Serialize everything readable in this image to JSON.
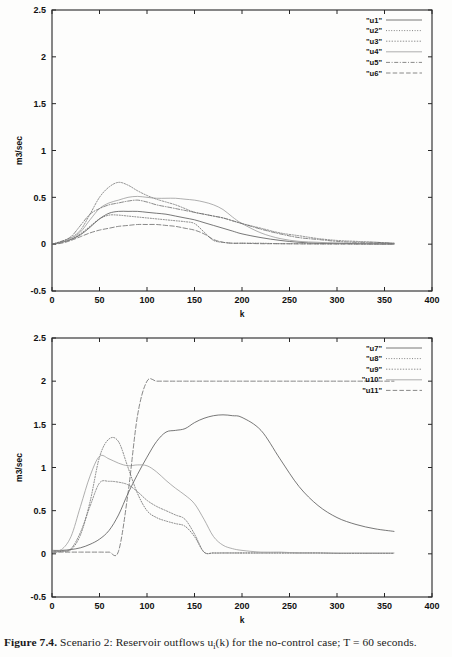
{
  "figure": {
    "caption_label": "Figure 7.4.",
    "caption_text_1": "Scenario 2: Reservoir outflows u",
    "caption_sub": "i",
    "caption_text_2": "(k) for the no-control case; T = 60 seconds."
  },
  "chart_data": [
    {
      "id": "top-chart",
      "type": "line",
      "title": "",
      "xlabel": "k",
      "ylabel": "m3/sec",
      "xlim": [
        0,
        400
      ],
      "ylim": [
        -0.5,
        2.5
      ],
      "xticks": [
        0,
        50,
        100,
        150,
        200,
        250,
        300,
        350,
        400
      ],
      "yticks": [
        -0.5,
        0,
        0.5,
        1,
        1.5,
        2,
        2.5
      ],
      "grid": false,
      "legend_position": "top-right",
      "legend_entries": [
        "\"u1\"",
        "\"u2\"",
        "\"u3\"",
        "\"u4\"",
        "\"u5\"",
        "\"u6\""
      ],
      "x": [
        0,
        10,
        20,
        30,
        40,
        50,
        60,
        70,
        80,
        90,
        100,
        110,
        120,
        130,
        140,
        150,
        160,
        170,
        180,
        190,
        200,
        220,
        240,
        260,
        280,
        300,
        320,
        340,
        360
      ],
      "series": [
        {
          "name": "\"u1\"",
          "dash": "solid",
          "values": [
            0.0,
            0.02,
            0.05,
            0.1,
            0.18,
            0.27,
            0.33,
            0.35,
            0.35,
            0.35,
            0.34,
            0.33,
            0.32,
            0.3,
            0.28,
            0.26,
            0.23,
            0.2,
            0.17,
            0.14,
            0.11,
            0.07,
            0.04,
            0.02,
            0.01,
            0.01,
            0.005,
            0.003,
            0.002
          ]
        },
        {
          "name": "\"u2\"",
          "dash": "dotted-fine",
          "values": [
            0.0,
            0.02,
            0.05,
            0.11,
            0.19,
            0.27,
            0.31,
            0.31,
            0.3,
            0.29,
            0.28,
            0.27,
            0.26,
            0.25,
            0.24,
            0.22,
            0.13,
            0.04,
            0.02,
            0.01,
            0.01,
            0.01,
            0.005,
            0.005,
            0.003,
            0.003,
            0.002,
            0.002,
            0.002
          ]
        },
        {
          "name": "\"u3\"",
          "dash": "dotted",
          "values": [
            0.0,
            0.03,
            0.07,
            0.15,
            0.32,
            0.5,
            0.61,
            0.66,
            0.63,
            0.57,
            0.52,
            0.48,
            0.45,
            0.42,
            0.38,
            0.34,
            0.32,
            0.3,
            0.28,
            0.25,
            0.22,
            0.17,
            0.12,
            0.09,
            0.06,
            0.04,
            0.03,
            0.02,
            0.01
          ]
        },
        {
          "name": "\"u4\"",
          "dash": "solid-light",
          "values": [
            0.0,
            0.02,
            0.06,
            0.13,
            0.26,
            0.38,
            0.44,
            0.47,
            0.5,
            0.51,
            0.5,
            0.49,
            0.49,
            0.49,
            0.48,
            0.47,
            0.45,
            0.42,
            0.37,
            0.29,
            0.22,
            0.12,
            0.06,
            0.03,
            0.02,
            0.01,
            0.01,
            0.005,
            0.003
          ]
        },
        {
          "name": "\"u5\"",
          "dash": "dashdot",
          "values": [
            0.0,
            0.03,
            0.08,
            0.2,
            0.32,
            0.38,
            0.42,
            0.44,
            0.46,
            0.47,
            0.45,
            0.42,
            0.4,
            0.38,
            0.36,
            0.34,
            0.32,
            0.3,
            0.28,
            0.25,
            0.22,
            0.16,
            0.11,
            0.07,
            0.05,
            0.03,
            0.02,
            0.02,
            0.01
          ]
        },
        {
          "name": "\"u6\"",
          "dash": "dashed",
          "values": [
            0.0,
            0.01,
            0.04,
            0.08,
            0.12,
            0.15,
            0.17,
            0.19,
            0.2,
            0.21,
            0.21,
            0.21,
            0.2,
            0.19,
            0.17,
            0.15,
            0.11,
            0.05,
            0.02,
            0.01,
            0.01,
            0.005,
            0.005,
            0.003,
            0.003,
            0.002,
            0.002,
            0.002,
            0.002
          ]
        }
      ]
    },
    {
      "id": "bottom-chart",
      "type": "line",
      "title": "",
      "xlabel": "k",
      "ylabel": "m3/sec",
      "xlim": [
        0,
        400
      ],
      "ylim": [
        -0.5,
        2.5
      ],
      "xticks": [
        0,
        50,
        100,
        150,
        200,
        250,
        300,
        350,
        400
      ],
      "yticks": [
        -0.5,
        0,
        0.5,
        1,
        1.5,
        2,
        2.5
      ],
      "grid": false,
      "legend_position": "top-right",
      "legend_entries": [
        "\"u7\"",
        "\"u8\"",
        "\"u9\"",
        "\"u10\"",
        "\"u11\""
      ],
      "x": [
        0,
        10,
        20,
        30,
        40,
        50,
        60,
        70,
        80,
        90,
        100,
        110,
        120,
        130,
        140,
        150,
        160,
        170,
        180,
        190,
        200,
        220,
        240,
        260,
        280,
        300,
        320,
        340,
        360
      ],
      "series": [
        {
          "name": "\"u7\"",
          "dash": "solid",
          "values": [
            0.04,
            0.04,
            0.05,
            0.07,
            0.11,
            0.17,
            0.27,
            0.45,
            0.7,
            0.92,
            1.12,
            1.3,
            1.41,
            1.43,
            1.45,
            1.52,
            1.57,
            1.6,
            1.61,
            1.6,
            1.58,
            1.43,
            1.1,
            0.78,
            0.56,
            0.42,
            0.34,
            0.29,
            0.26
          ]
        },
        {
          "name": "\"u8\"",
          "dash": "dotted-fine",
          "values": [
            0.02,
            0.03,
            0.05,
            0.22,
            0.6,
            1.12,
            1.33,
            1.3,
            1.0,
            0.7,
            0.5,
            0.42,
            0.38,
            0.35,
            0.32,
            0.2,
            0.02,
            0.01,
            0.01,
            0.01,
            0.01,
            0.01,
            0.01,
            0.01,
            0.01,
            0.005,
            0.005,
            0.005,
            0.005
          ]
        },
        {
          "name": "\"u9\"",
          "dash": "dotted",
          "values": [
            0.02,
            0.03,
            0.06,
            0.25,
            0.55,
            0.82,
            0.84,
            0.83,
            0.8,
            0.72,
            0.62,
            0.55,
            0.5,
            0.45,
            0.4,
            0.23,
            0.02,
            0.01,
            0.01,
            0.01,
            0.01,
            0.01,
            0.01,
            0.01,
            0.01,
            0.005,
            0.005,
            0.005,
            0.005
          ]
        },
        {
          "name": "\"u10\"",
          "dash": "solid-light",
          "values": [
            0.03,
            0.05,
            0.2,
            0.55,
            0.9,
            1.13,
            1.1,
            1.05,
            1.02,
            1.03,
            1.02,
            0.95,
            0.85,
            0.76,
            0.68,
            0.58,
            0.4,
            0.2,
            0.1,
            0.06,
            0.04,
            0.02,
            0.02,
            0.01,
            0.01,
            0.01,
            0.01,
            0.01,
            0.01
          ]
        },
        {
          "name": "\"u11\"",
          "dash": "dashed",
          "values": [
            0.02,
            0.02,
            0.02,
            0.02,
            0.02,
            0.02,
            0.02,
            0.03,
            0.7,
            1.6,
            2.0,
            2.0,
            2.0,
            2.0,
            2.0,
            2.0,
            2.0,
            2.0,
            2.0,
            2.0,
            2.0,
            2.0,
            2.0,
            2.0,
            2.0,
            2.0,
            2.0,
            2.0,
            2.0
          ]
        }
      ]
    }
  ]
}
